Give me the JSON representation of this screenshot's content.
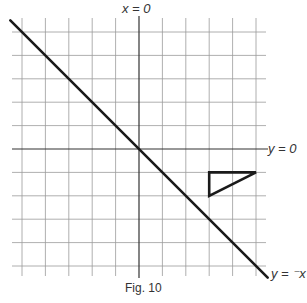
{
  "figure": {
    "caption": "Fig. 10",
    "labels": {
      "x_axis_line": "x = 0",
      "y_axis_line": "y = 0",
      "diagonal_line": "y = ⁻x"
    },
    "grid": {
      "x_range": [
        -5,
        5
      ],
      "y_range": [
        -5,
        5
      ],
      "unit": 1
    },
    "colors": {
      "grid": "#9a9a9a",
      "axis": "#333333",
      "line": "#1a1a1a"
    }
  },
  "chart_data": {
    "type": "line",
    "title": "Fig. 10",
    "xlabel": "",
    "ylabel": "",
    "xlim": [
      -5.5,
      5.5
    ],
    "ylim": [
      -5.5,
      5.5
    ],
    "grid": true,
    "series": [
      {
        "name": "y = ⁻x",
        "points": [
          [
            -5.5,
            5.5
          ],
          [
            5.5,
            -5.5
          ]
        ]
      },
      {
        "name": "triangle",
        "points": [
          [
            3,
            -1
          ],
          [
            5,
            -1
          ],
          [
            3,
            -2
          ],
          [
            3,
            -1
          ]
        ]
      }
    ],
    "annotations": [
      "x = 0",
      "y = 0",
      "y = ⁻x"
    ]
  }
}
